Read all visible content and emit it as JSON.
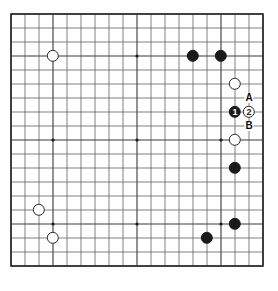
{
  "figure": {
    "kind": "go-board-diagram",
    "board_size": 19,
    "background_color": "#ffffff"
  },
  "board": {
    "origin_x": 11,
    "origin_y": 14,
    "spacing": 14,
    "line_color": "#4a4a4a",
    "major_line_color": "#3a3a3a",
    "border_color": "#2b2b2b",
    "star_point_color": "#1a1a1a",
    "star_point_radius": 1.6,
    "star_lines": [
      4,
      10,
      16
    ],
    "star_points": [
      {
        "col": 4,
        "row": 4
      },
      {
        "col": 10,
        "row": 4
      },
      {
        "col": 16,
        "row": 4
      },
      {
        "col": 4,
        "row": 10
      },
      {
        "col": 10,
        "row": 10
      },
      {
        "col": 16,
        "row": 10
      },
      {
        "col": 4,
        "row": 16
      },
      {
        "col": 10,
        "row": 16
      },
      {
        "col": 16,
        "row": 16
      }
    ]
  },
  "stones": {
    "black_color": "#1a1a1a",
    "white_color": "#ffffff",
    "radius": 6.2,
    "items": [
      {
        "id": "white-upper-left-hoshi",
        "color": "white",
        "col": 4,
        "row": 4,
        "label": ""
      },
      {
        "id": "black-top-right-a",
        "color": "black",
        "col": 14,
        "row": 4,
        "label": ""
      },
      {
        "id": "black-top-right-hoshi",
        "color": "black",
        "col": 16,
        "row": 4,
        "label": ""
      },
      {
        "id": "white-right-upper",
        "color": "white",
        "col": 17,
        "row": 6,
        "label": ""
      },
      {
        "id": "black-move-1",
        "color": "black",
        "col": 17,
        "row": 8,
        "label": "1"
      },
      {
        "id": "white-move-2",
        "color": "white",
        "col": 18,
        "row": 8,
        "label": "2"
      },
      {
        "id": "white-right-hoshi",
        "color": "white",
        "col": 17,
        "row": 10,
        "label": ""
      },
      {
        "id": "black-right-lower",
        "color": "black",
        "col": 17,
        "row": 12,
        "label": ""
      },
      {
        "id": "white-lower-left-upper",
        "color": "white",
        "col": 3,
        "row": 15,
        "label": ""
      },
      {
        "id": "white-lower-left-hoshi",
        "color": "white",
        "col": 4,
        "row": 17,
        "label": ""
      },
      {
        "id": "black-lower-right-hoshi",
        "color": "black",
        "col": 17,
        "row": 16,
        "label": ""
      },
      {
        "id": "black-bottom-right",
        "color": "black",
        "col": 15,
        "row": 17,
        "label": ""
      }
    ]
  },
  "point_labels": {
    "items": [
      {
        "id": "label-a",
        "text": "A",
        "col": 18,
        "row": 7
      },
      {
        "id": "label-b",
        "text": "B",
        "col": 18,
        "row": 9
      }
    ]
  }
}
